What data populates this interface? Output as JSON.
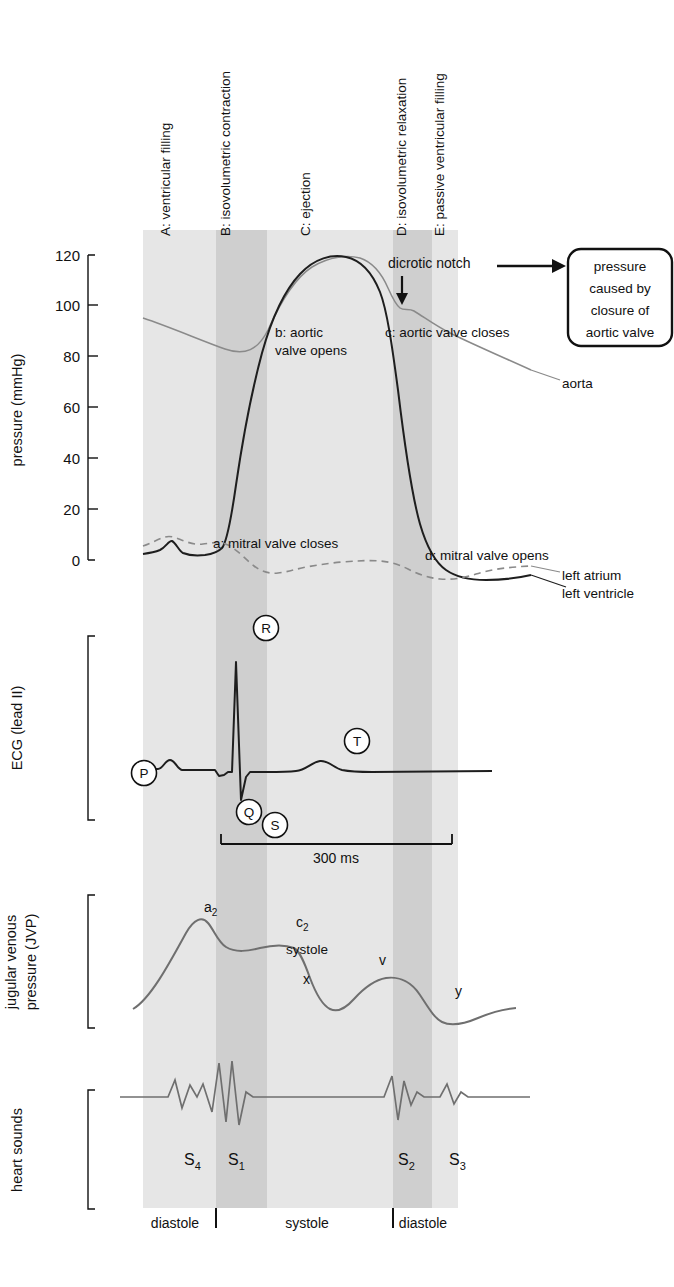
{
  "figure": {
    "type": "wiggers-diagram",
    "width": 674,
    "height": 1287,
    "colors": {
      "band_light": "#e6e6e6",
      "band_dark": "#cfcfcf",
      "curve_dark": "#222222",
      "curve_grey": "#777777",
      "background": "#ffffff"
    }
  },
  "phases": [
    {
      "key": "A",
      "label": "A: ventricular filling",
      "x": 143,
      "width": 73,
      "shade": "light"
    },
    {
      "key": "B",
      "label": "B: isovolumetric contraction",
      "x": 216,
      "width": 51,
      "shade": "dark"
    },
    {
      "key": "C",
      "label": "C: ejection",
      "x": 267,
      "width": 126,
      "shade": "light"
    },
    {
      "key": "D",
      "label": "D: isovolumetric relaxation",
      "x": 393,
      "width": 39,
      "shade": "dark"
    },
    {
      "key": "E",
      "label": "E: passive ventricular filling",
      "x": 432,
      "width": 26,
      "shade": "light"
    }
  ],
  "phase_label_x": {
    "A": 170,
    "B": 230,
    "C": 310,
    "D": 406,
    "E": 444
  },
  "pressure_panel": {
    "axis_title": "pressure (mmHg)",
    "unit": "mmHg",
    "ticks": [
      0,
      20,
      40,
      60,
      80,
      100,
      120
    ],
    "tick_labels": [
      "0",
      "20",
      "40",
      "60",
      "80",
      "100",
      "120"
    ],
    "ylim": [
      0,
      120
    ],
    "curve_labels": {
      "a": "a: mitral valve closes",
      "b_line1": "b: aortic",
      "b_line2": "valve opens",
      "c": "c: aortic valve closes",
      "d": "d: mitral valve opens",
      "aorta": "aorta",
      "left_atrium": "left atrium",
      "left_ventricle": "left ventricle",
      "dicrotic_notch": "dicrotic notch"
    },
    "callout": {
      "line1": "pressure",
      "line2": "caused by",
      "line3": "closure of",
      "line4": "aortic valve"
    }
  },
  "ecg_panel": {
    "axis_title": "ECG (lead II)",
    "waves": [
      "P",
      "Q",
      "R",
      "S",
      "T"
    ],
    "interval_label": "300 ms",
    "interval_ms": 300
  },
  "jvp_panel": {
    "axis_title_line1": "jugular venous",
    "axis_title_line2": "pressure (JVP)",
    "waves": [
      {
        "name": "a",
        "sub": "2"
      },
      {
        "name": "c",
        "sub": "2"
      },
      {
        "name": "x",
        "sub": ""
      },
      {
        "name": "v",
        "sub": ""
      },
      {
        "name": "y",
        "sub": ""
      }
    ],
    "systole_label": "systole"
  },
  "heart_sounds_panel": {
    "axis_title": "heart sounds",
    "sounds": [
      {
        "name": "S",
        "sub": "4",
        "x": 184
      },
      {
        "name": "S",
        "sub": "1",
        "x": 228
      },
      {
        "name": "S",
        "sub": "2",
        "x": 398
      },
      {
        "name": "S",
        "sub": "3",
        "x": 449
      }
    ]
  },
  "cycle_axis": {
    "segments": [
      {
        "label": "diastole",
        "x": 175
      },
      {
        "label": "systole",
        "x": 307
      },
      {
        "label": "diastole",
        "x": 423
      }
    ],
    "dividers_x": [
      216,
      393
    ]
  },
  "chart_data": {
    "type": "line",
    "xlabel": "time (cardiac cycle)",
    "ylabel": "pressure (mmHg)",
    "ylim": [
      0,
      120
    ],
    "grid": false,
    "legend": [
      "aorta",
      "left atrium",
      "left ventricle"
    ],
    "legend_position": "inline-right",
    "series": [
      {
        "name": "aorta",
        "style": "solid-grey",
        "points": [
          [
            0,
            93
          ],
          [
            10,
            88
          ],
          [
            18,
            82
          ],
          [
            25,
            77
          ],
          [
            30,
            75
          ],
          [
            35,
            78
          ],
          [
            40,
            95
          ],
          [
            45,
            112
          ],
          [
            50,
            116
          ],
          [
            55,
            115
          ],
          [
            60,
            110
          ],
          [
            63,
            100
          ],
          [
            66,
            95
          ],
          [
            68,
            97
          ],
          [
            72,
            92
          ],
          [
            78,
            87
          ],
          [
            85,
            82
          ],
          [
            92,
            78
          ],
          [
            100,
            74
          ]
        ]
      },
      {
        "name": "left ventricle",
        "style": "solid-dark",
        "points": [
          [
            0,
            2
          ],
          [
            8,
            3
          ],
          [
            12,
            8
          ],
          [
            16,
            6
          ],
          [
            20,
            5
          ],
          [
            24,
            5
          ],
          [
            27,
            8
          ],
          [
            30,
            28
          ],
          [
            34,
            62
          ],
          [
            38,
            90
          ],
          [
            43,
            108
          ],
          [
            48,
            115
          ],
          [
            52,
            116
          ],
          [
            56,
            112
          ],
          [
            60,
            100
          ],
          [
            63,
            86
          ],
          [
            66,
            60
          ],
          [
            69,
            30
          ],
          [
            72,
            10
          ],
          [
            75,
            0
          ],
          [
            80,
            -4
          ],
          [
            88,
            -5
          ],
          [
            95,
            -3
          ],
          [
            100,
            -1
          ]
        ]
      },
      {
        "name": "left atrium",
        "style": "dashed-grey",
        "points": [
          [
            0,
            5
          ],
          [
            8,
            8
          ],
          [
            12,
            9
          ],
          [
            16,
            6
          ],
          [
            20,
            7
          ],
          [
            24,
            8
          ],
          [
            28,
            6
          ],
          [
            32,
            1
          ],
          [
            36,
            -3
          ],
          [
            40,
            -5
          ],
          [
            45,
            -4
          ],
          [
            50,
            -2
          ],
          [
            55,
            0
          ],
          [
            60,
            1
          ],
          [
            66,
            1
          ],
          [
            70,
            -1
          ],
          [
            75,
            -4
          ],
          [
            80,
            -5
          ],
          [
            86,
            -4
          ],
          [
            92,
            -2
          ],
          [
            100,
            -1
          ]
        ]
      }
    ],
    "annotations": [
      {
        "text": "a: mitral valve closes",
        "x": 27,
        "y": 7
      },
      {
        "text": "b: aortic valve opens",
        "x": 37,
        "y": 88
      },
      {
        "text": "c: aortic valve closes",
        "x": 64,
        "y": 88
      },
      {
        "text": "d: mitral valve opens",
        "x": 76,
        "y": 6
      },
      {
        "text": "dicrotic notch",
        "x": 66,
        "y": 118
      }
    ],
    "subplots": [
      {
        "name": "ECG (lead II)",
        "waves": [
          "P",
          "Q",
          "R",
          "S",
          "T"
        ],
        "interval": "300 ms"
      },
      {
        "name": "jugular venous pressure (JVP)",
        "waves": [
          "a2",
          "c2",
          "x",
          "v",
          "y"
        ]
      },
      {
        "name": "heart sounds",
        "waves": [
          "S4",
          "S1",
          "S2",
          "S3"
        ]
      }
    ]
  }
}
